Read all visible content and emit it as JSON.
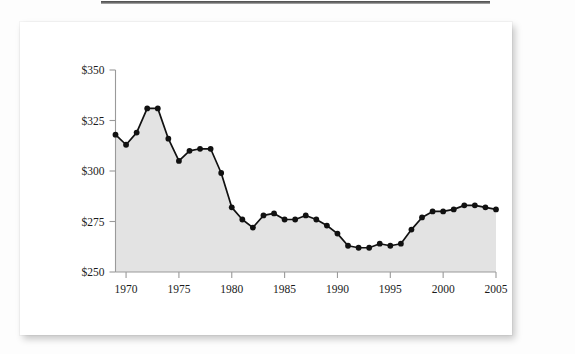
{
  "figure": {
    "card_background": "#ffffff",
    "rule_color": "#4a4a4a"
  },
  "chart_data": {
    "type": "area",
    "title": "",
    "subtitle": "",
    "xlabel": "",
    "ylabel": "",
    "grid": false,
    "legend": null,
    "legend_position": "none",
    "line_color": "#111111",
    "fill_color": "#e3e3e3",
    "marker_color": "#111111",
    "xlim": [
      1969,
      2005
    ],
    "ylim": [
      250,
      350
    ],
    "xticks": [
      1970,
      1975,
      1980,
      1985,
      1990,
      1995,
      2000,
      2005
    ],
    "xtick_labels": [
      "1970",
      "1975",
      "1980",
      "1985",
      "1990",
      "1995",
      "2000",
      "2005"
    ],
    "yticks": [
      250,
      275,
      300,
      325,
      350
    ],
    "ytick_labels": [
      "$250",
      "$275",
      "$300",
      "$325",
      "$350"
    ],
    "x": [
      1969,
      1970,
      1971,
      1972,
      1973,
      1974,
      1975,
      1976,
      1977,
      1978,
      1979,
      1980,
      1981,
      1982,
      1983,
      1984,
      1985,
      1986,
      1987,
      1988,
      1989,
      1990,
      1991,
      1992,
      1993,
      1994,
      1995,
      1996,
      1997,
      1998,
      1999,
      2000,
      2001,
      2002,
      2003,
      2004,
      2005
    ],
    "values": [
      318,
      313,
      319,
      331,
      331,
      316,
      305,
      310,
      311,
      311,
      299,
      282,
      276,
      272,
      278,
      279,
      276,
      276,
      278,
      276,
      273,
      269,
      263,
      262,
      262,
      264,
      263,
      264,
      271,
      277,
      280,
      280,
      281,
      283,
      283,
      282,
      281
    ],
    "series": [
      {
        "name": "value",
        "values": [
          318,
          313,
          319,
          331,
          331,
          316,
          305,
          310,
          311,
          311,
          299,
          282,
          276,
          272,
          278,
          279,
          276,
          276,
          278,
          276,
          273,
          269,
          263,
          262,
          262,
          264,
          263,
          264,
          271,
          277,
          280,
          280,
          281,
          283,
          283,
          282,
          281
        ]
      }
    ]
  }
}
